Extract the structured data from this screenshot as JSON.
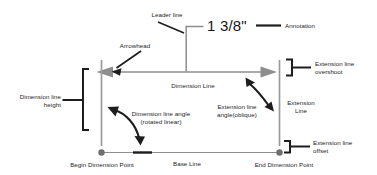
{
  "diagram": {
    "background_color": "#ffffff",
    "colors": {
      "geometry_gray": "#8e8e8e",
      "callout_black": "#1d1d1d",
      "text": "#1d1d1d",
      "point_fill": "#707070"
    },
    "annotation_value": "1 3/8\"",
    "labels": {
      "leader_line": "Leader line",
      "annotation": "Annotation",
      "arrowhead": "Arrowhead",
      "extension_line_overshoot_1": "Extension line",
      "extension_line_overshoot_2": "overshoot",
      "dimension_line_height_1": "Dimension line",
      "dimension_line_height_2": "height",
      "dimension_line": "Dimension Line",
      "dimension_line_angle_1": "Dimension line angle",
      "dimension_line_angle_2": "(rotated linear)",
      "extension_line_angle_1": "Extension line",
      "extension_line_angle_2": "angle(oblique)",
      "extension_line_1": "Extension",
      "extension_line_2": "Line",
      "extension_line_offset_1": "Extension line",
      "extension_line_offset_2": "offset",
      "begin_dimension_point": "Begin Dimension Point",
      "base_line": "Base Line",
      "end_dimension_point": "End Dimension Point"
    }
  }
}
